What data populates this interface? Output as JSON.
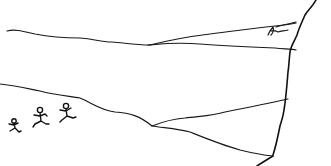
{
  "illustration": {
    "title": "Line drawing of a hillside and cliff with three small running figures",
    "style": "black ink sketch on white",
    "colors": {
      "background": "#ffffff",
      "ink": "#1a1a1a"
    },
    "elements": {
      "figures_count": 3,
      "signature": "artist signature (illegible scrawl)"
    }
  }
}
